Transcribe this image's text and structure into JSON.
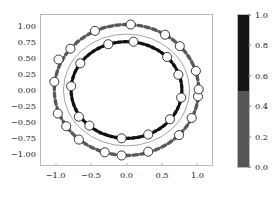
{
  "chart_data": {
    "type": "scatter",
    "title": "",
    "xlabel": "",
    "ylabel": "",
    "xlim": [
      -1.22,
      1.22
    ],
    "ylim": [
      -1.18,
      1.18
    ],
    "grid": false,
    "legend": null,
    "xticks": [
      "-1.0",
      "-0.5",
      "0.0",
      "0.5",
      "1.0"
    ],
    "xtick_values": [
      -1.0,
      -0.5,
      0.0,
      0.5,
      1.0
    ],
    "yticks": [
      "1.00",
      "0.75",
      "0.50",
      "0.25",
      "0.00",
      "-0.25",
      "-0.50",
      "-0.75",
      "-1.00"
    ],
    "ytick_values": [
      1.0,
      0.75,
      0.5,
      0.25,
      0.0,
      -0.25,
      -0.5,
      -0.75,
      -1.0
    ],
    "series": [
      {
        "name": "outer-dashed-ring",
        "style": "dashed-ring",
        "color": "#595959",
        "radius_x": 1.03,
        "radius_y": 1.03,
        "center": [
          0.0,
          0.0
        ],
        "dash_count": 58,
        "linewidth": 3.4
      },
      {
        "name": "middle-solid-ring",
        "style": "solid-ring",
        "color": "#8a8a8a",
        "radius_x": 0.9,
        "radius_y": 0.88,
        "center": [
          0.0,
          0.0
        ],
        "linewidth": 0.8
      },
      {
        "name": "inner-dashed-ring",
        "style": "dashed-ring",
        "color": "#111111",
        "radius_x": 0.79,
        "radius_y": 0.76,
        "center": [
          0.0,
          0.0
        ],
        "dash_count": 58,
        "linewidth": 3.4
      },
      {
        "name": "outer-markers",
        "style": "circle-markers",
        "facecolor": "#ffffff",
        "edgecolor": "#222222",
        "marker_radius_px": 4.6,
        "points": [
          [
            0.06,
            1.03
          ],
          [
            -0.45,
            0.93
          ],
          [
            -0.8,
            0.65
          ],
          [
            -0.97,
            0.48
          ],
          [
            -1.03,
            0.13
          ],
          [
            -0.98,
            -0.37
          ],
          [
            -0.86,
            -0.57
          ],
          [
            -0.68,
            -0.78
          ],
          [
            -0.31,
            -0.98
          ],
          [
            -0.07,
            -1.03
          ],
          [
            0.31,
            -0.97
          ],
          [
            0.75,
            -0.71
          ],
          [
            0.93,
            -0.44
          ],
          [
            1.02,
            -0.1
          ],
          [
            1.03,
            0.01
          ],
          [
            0.99,
            0.3
          ],
          [
            0.76,
            0.69
          ],
          [
            0.55,
            0.87
          ]
        ]
      },
      {
        "name": "inner-markers",
        "style": "circle-markers",
        "facecolor": "#ffffff",
        "edgecolor": "#222222",
        "marker_radius_px": 4.6,
        "points": [
          [
            0.1,
            0.76
          ],
          [
            -0.26,
            0.72
          ],
          [
            -0.66,
            0.42
          ],
          [
            -0.79,
            0.06
          ],
          [
            -0.68,
            -0.42
          ],
          [
            -0.53,
            -0.56
          ],
          [
            -0.07,
            -0.76
          ],
          [
            0.31,
            -0.7
          ],
          [
            0.62,
            -0.46
          ],
          [
            0.78,
            -0.12
          ],
          [
            0.74,
            0.24
          ],
          [
            0.58,
            0.52
          ]
        ]
      }
    ],
    "colorbar": {
      "orientation": "vertical",
      "vmin": 0.0,
      "vmax": 1.0,
      "ticks": [
        "1.0",
        "0.8",
        "0.6",
        "0.4",
        "0.2",
        "0.0"
      ],
      "tick_values": [
        1.0,
        0.8,
        0.6,
        0.4,
        0.2,
        0.0
      ],
      "levels": [
        {
          "from": 0.5,
          "to": 1.0,
          "color": "#141414"
        },
        {
          "from": 0.0,
          "to": 0.5,
          "color": "#565656"
        }
      ]
    }
  },
  "figure": {
    "facecolor": "#ffffff",
    "spine_color": "#b9b9b9",
    "text_color": "#1a1a1a"
  }
}
